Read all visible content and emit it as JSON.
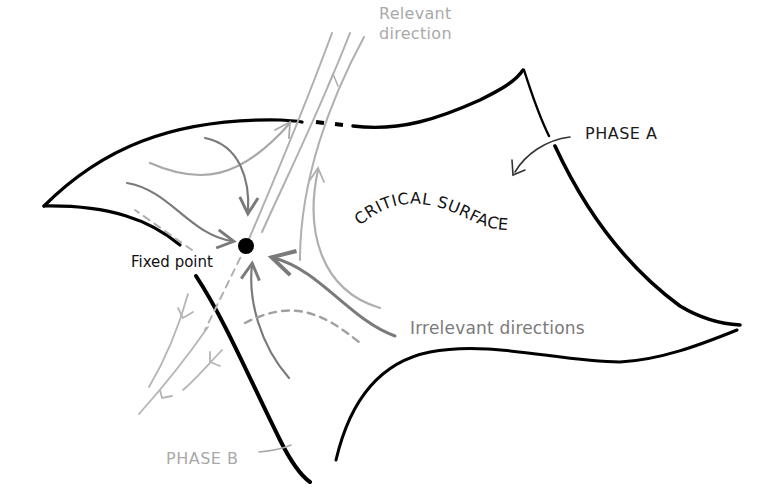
{
  "diagram": {
    "labels": {
      "relevant_direction": [
        "Relevant",
        "direction"
      ],
      "phase_a": "PHASE A",
      "phase_b": "PHASE B",
      "critical_surface": "CRITICAL SURFACE",
      "fixed_point": "Fixed point",
      "irrelevant_directions": "Irrelevant directions"
    },
    "colors": {
      "surface_edge": "#000000",
      "relevant_flow": "#b0b0b0",
      "irrelevant_flow": "#7a7a7a",
      "phase_b_flow": "#b5b5b5",
      "fixed_point": "#000000",
      "phase_a_label": "#1a1a1a",
      "phase_b_label": "#a9a9a9"
    },
    "nodes": [
      {
        "id": "fixed-point",
        "label": "Fixed point",
        "x": 246,
        "y": 246
      }
    ],
    "regions": [
      {
        "id": "critical-surface",
        "label": "CRITICAL SURFACE"
      },
      {
        "id": "phase-a",
        "label": "PHASE A"
      },
      {
        "id": "phase-b",
        "label": "PHASE B"
      }
    ],
    "flows": [
      {
        "type": "relevant",
        "direction": "away from fixed point, out of surface"
      },
      {
        "type": "irrelevant",
        "direction": "toward fixed point within surface"
      }
    ]
  }
}
